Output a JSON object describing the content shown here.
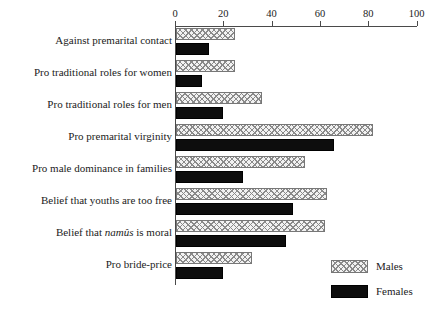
{
  "chart_data": {
    "type": "bar",
    "orientation": "horizontal",
    "title": "",
    "xlabel": "",
    "ylabel": "",
    "xlim": [
      0,
      100
    ],
    "xticks": [
      0,
      20,
      40,
      60,
      80,
      100
    ],
    "xtick_labels": [
      "0",
      "20",
      "40",
      "60",
      "80",
      "100"
    ],
    "grid": false,
    "legend_position": "bottom-right",
    "categories": [
      "Against premarital contact",
      "Pro traditional roles for women",
      "Pro traditional roles for men",
      "Pro premarital virginity",
      "Pro male dominance in families",
      "Belief that youths are too free",
      "Belief that namûs is moral",
      "Pro bride-price"
    ],
    "category_labels_html": [
      "Against premarital contact",
      "Pro traditional roles for women",
      "Pro traditional roles for men",
      "Pro premarital virginity",
      "Pro male dominance in families",
      "Belief that youths are too free",
      "Belief that <i>namûs</i> is moral",
      "Pro bride-price"
    ],
    "series": [
      {
        "name": "Males",
        "color": "#f2f2f2",
        "pattern": "crosshatch",
        "values": [
          25,
          25,
          36,
          82,
          54,
          63,
          62,
          32
        ]
      },
      {
        "name": "Females",
        "color": "#0d0d0d",
        "pattern": "solid",
        "values": [
          14,
          11,
          20,
          66,
          28,
          49,
          46,
          20
        ]
      }
    ]
  },
  "legend": {
    "items": [
      {
        "label": "Males"
      },
      {
        "label": "Females"
      }
    ]
  },
  "colors": {
    "axis": "#4a4a4a",
    "text": "#1b1b1b",
    "males_fill": "#f2f2f2",
    "males_hatch": "#8a8a8a",
    "females_fill": "#0d0d0d",
    "background": "#ffffff"
  }
}
